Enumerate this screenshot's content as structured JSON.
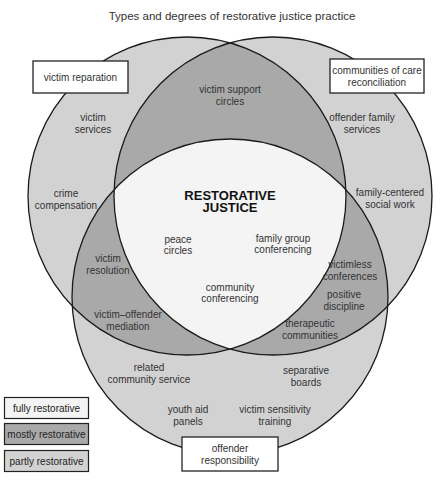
{
  "title": "Types and degrees of restorative justice practice",
  "colors": {
    "fully_restorative": "#f4f4f4",
    "mostly_restorative": "#a9a9a9",
    "partly_restorative": "#d2d2d2",
    "outline": "#1a1a1a"
  },
  "circle_labels": {
    "victim": "victim reparation",
    "community": [
      "communities of care",
      "reconciliation"
    ],
    "offender": [
      "offender",
      "responsibility"
    ]
  },
  "core": [
    "RESTORATIVE",
    "JUSTICE"
  ],
  "regions": {
    "victim_only": [
      [
        "victim",
        "services"
      ],
      [
        "crime",
        "compensation"
      ]
    ],
    "community_only": [
      [
        "offender family",
        "services"
      ],
      [
        "family-centered",
        "social work"
      ]
    ],
    "offender_only": [
      [
        "related",
        "community service"
      ],
      [
        "separative",
        "boards"
      ],
      [
        "youth aid",
        "panels"
      ],
      [
        "victim sensitivity",
        "training"
      ]
    ],
    "victim_community": [
      [
        "victim support",
        "circles"
      ]
    ],
    "victim_offender": [
      [
        "victim",
        "resolution"
      ],
      [
        "victim–offender",
        "mediation"
      ]
    ],
    "community_offender": [
      [
        "victimless",
        "conferences"
      ],
      [
        "positive",
        "discipline"
      ],
      [
        "therapeutic",
        "communities"
      ]
    ],
    "all_three": [
      [
        "peace",
        "circles"
      ],
      [
        "family group",
        "conferencing"
      ],
      [
        "community",
        "conferencing"
      ]
    ]
  },
  "legend": [
    {
      "label": "fully restorative",
      "color": "#f4f4f4"
    },
    {
      "label": "mostly restorative",
      "color": "#a9a9a9"
    },
    {
      "label": "partly restorative",
      "color": "#d2d2d2"
    }
  ]
}
